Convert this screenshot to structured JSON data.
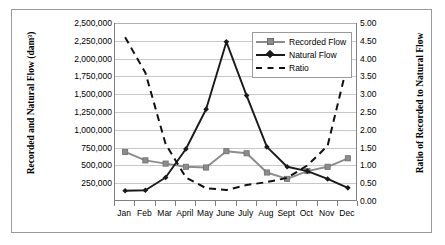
{
  "chart_data": {
    "type": "line",
    "title": "",
    "xlabel": "",
    "categories": [
      "Jan",
      "Feb",
      "Mar",
      "April",
      "May",
      "June",
      "July",
      "Aug",
      "Sept",
      "Oct",
      "Nov",
      "Dec"
    ],
    "grid": true,
    "legend_position": "top-right",
    "axes": {
      "left": {
        "label": "Recorded and Natural Flow (dam³)",
        "min": 0,
        "max": 2500000,
        "step": 250000,
        "ticks": [
          "250,000",
          "500,000",
          "750,000",
          "1,000,000",
          "1,250,000",
          "1,500,000",
          "1,750,000",
          "2,000,000",
          "2,250,000",
          "2,500,000"
        ]
      },
      "right": {
        "label": "Ratio of Recorded to Natural Flow",
        "min": 0,
        "max": 5.0,
        "step": 0.5,
        "ticks": [
          "0.00",
          "0.50",
          "1.00",
          "1.50",
          "2.00",
          "2.50",
          "3.00",
          "3.50",
          "4.00",
          "4.50",
          "5.00"
        ]
      }
    },
    "series": [
      {
        "name": "Recorded Flow",
        "axis": "left",
        "color": "#8c8c8c",
        "marker": "square",
        "dash": false,
        "values": [
          690000,
          570000,
          525000,
          480000,
          470000,
          700000,
          670000,
          400000,
          310000,
          420000,
          480000,
          600000
        ]
      },
      {
        "name": "Natural Flow",
        "axis": "left",
        "color": "#1a1a1a",
        "marker": "diamond",
        "dash": false,
        "values": [
          145000,
          150000,
          330000,
          730000,
          1290000,
          2235000,
          1480000,
          760000,
          480000,
          420000,
          310000,
          185000
        ]
      },
      {
        "name": "Ratio",
        "axis": "right",
        "color": "#111111",
        "marker": "none",
        "dash": true,
        "values": [
          4.6,
          3.6,
          1.6,
          0.66,
          0.36,
          0.31,
          0.45,
          0.53,
          0.65,
          1.0,
          1.55,
          3.9
        ]
      }
    ]
  }
}
